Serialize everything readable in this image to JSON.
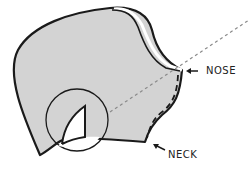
{
  "diagram": {
    "labels": {
      "nose": "NOSE",
      "neck": "NECK"
    },
    "colors": {
      "fill": "#d3d3d3",
      "stroke": "#1a1a1a",
      "dashed_line": "#8a8a8a",
      "background": "#ffffff"
    }
  }
}
